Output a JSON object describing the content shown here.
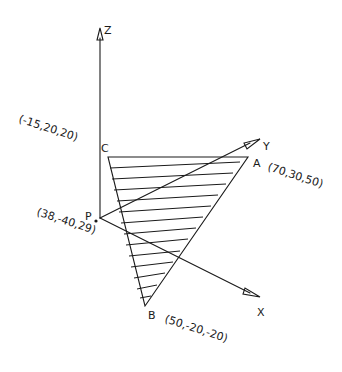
{
  "diagram": {
    "type": "3d-plane-triangle",
    "axes": {
      "z": {
        "label": "Z"
      },
      "y": {
        "label": "Y"
      },
      "x": {
        "label": "X"
      }
    },
    "vertices": {
      "a": {
        "label": "A",
        "coords": "(70,30,50)"
      },
      "b": {
        "label": "B",
        "coords": "(50,-20,-20)"
      },
      "c": {
        "label": "C",
        "coords": "(-15,20,20)"
      }
    },
    "point": {
      "label": "P",
      "coords": "(38,-40,29)"
    },
    "colors": {
      "line": "#1a1a1a",
      "background": "#ffffff"
    }
  }
}
